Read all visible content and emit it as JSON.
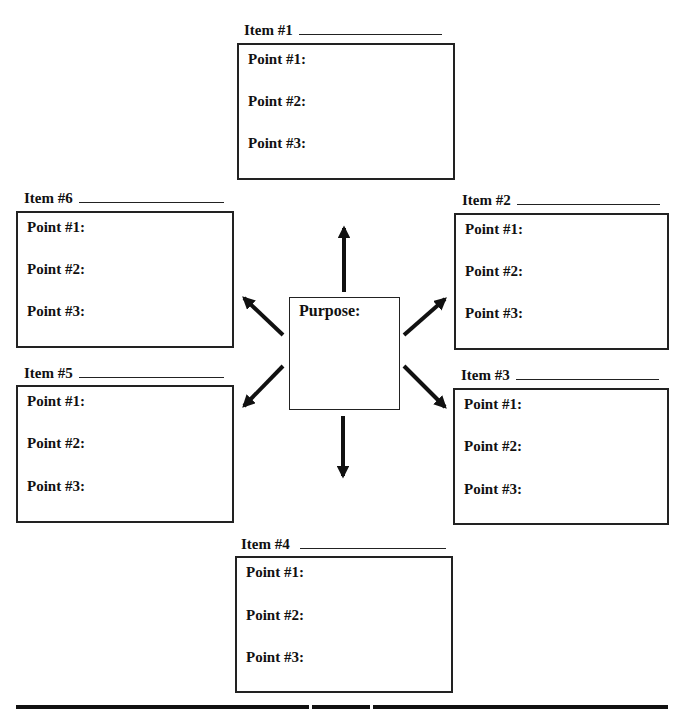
{
  "center": {
    "label": "Purpose:"
  },
  "items": [
    {
      "title": "Item #1",
      "points": [
        "Point #1:",
        "Point #2:",
        "Point #3:"
      ]
    },
    {
      "title": "Item #2",
      "points": [
        "Point #1:",
        "Point #2:",
        "Point #3:"
      ]
    },
    {
      "title": "Item #3",
      "points": [
        "Point #1:",
        "Point #2:",
        "Point #3:"
      ]
    },
    {
      "title": "Item #4",
      "points": [
        "Point #1:",
        "Point #2:",
        "Point #3:"
      ]
    },
    {
      "title": "Item #5",
      "points": [
        "Point #1:",
        "Point #2:",
        "Point #3:"
      ]
    },
    {
      "title": "Item #6",
      "points": [
        "Point #1:",
        "Point #2:",
        "Point #3:"
      ]
    }
  ]
}
